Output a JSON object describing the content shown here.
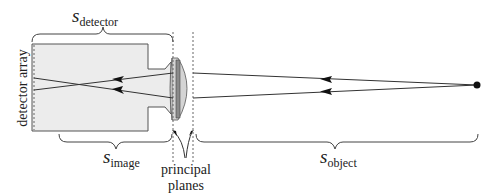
{
  "diagram": {
    "type": "optics-schematic",
    "labels": {
      "detector_distance": {
        "symbol": "s",
        "subscript": "detector"
      },
      "image_distance": {
        "symbol": "s",
        "subscript": "image"
      },
      "object_distance": {
        "symbol": "s",
        "subscript": "object"
      },
      "detector_array": "detector array",
      "principal_planes_line1": "principal",
      "principal_planes_line2": "planes"
    },
    "colors": {
      "body_fill": "#ececec",
      "stroke": "#444444",
      "lens_fill": "#cfcfcf",
      "lens_core": "#888888",
      "ray": "#333333",
      "object_point": "#111111"
    }
  }
}
